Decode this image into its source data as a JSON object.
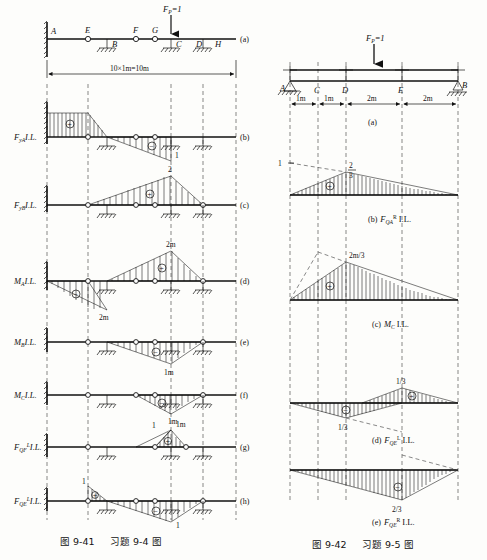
{
  "figure_left": {
    "caption_fig": "图 9-41",
    "caption_problem": "习题 9-4 图",
    "panel_letters": [
      "(a)",
      "(b)",
      "(c)",
      "(d)",
      "(e)",
      "(f)",
      "(g)",
      "(h)"
    ],
    "beam": {
      "load_label": "F",
      "load_sub": "P",
      "load_eq": "=1",
      "node_labels": [
        "A",
        "E",
        "F",
        "G",
        "H"
      ],
      "support_labels": [
        "B",
        "C",
        "D"
      ],
      "dimension": "10×1m=10m"
    },
    "rows": [
      {
        "id": "FyA",
        "label_main": "F",
        "label_sub": "yA",
        "label_sup": "",
        "label_tail": "I.L.",
        "signs": [
          "+",
          "−"
        ],
        "values": [
          "1"
        ]
      },
      {
        "id": "FyB",
        "label_main": "F",
        "label_sub": "yB",
        "label_sup": "",
        "label_tail": "I.L.",
        "signs": [
          "+"
        ],
        "values": [
          "2"
        ]
      },
      {
        "id": "MA",
        "label_main": "M",
        "label_sub": "A",
        "label_sup": "",
        "label_tail": "I.L.",
        "signs": [
          "−",
          "+"
        ],
        "values": [
          "2m",
          "2m"
        ]
      },
      {
        "id": "MB",
        "label_main": "M",
        "label_sub": "B",
        "label_sup": "",
        "label_tail": "I.L.",
        "signs": [
          "−"
        ],
        "values": [
          "1m"
        ]
      },
      {
        "id": "MC",
        "label_main": "M",
        "label_sub": "C",
        "label_sup": "",
        "label_tail": "I.L.",
        "signs": [
          "−"
        ],
        "values": [
          "1m"
        ]
      },
      {
        "id": "FQF-L",
        "label_main": "F",
        "label_sub": "QF",
        "label_sup": "L",
        "label_tail": "I.L.",
        "signs": [
          "+"
        ],
        "values": [
          "1",
          "1m"
        ]
      },
      {
        "id": "FQE-L",
        "label_main": "F",
        "label_sub": "QE",
        "label_sup": "L",
        "label_tail": "I.L.",
        "signs": [
          "+",
          "−"
        ],
        "values": [
          "1",
          "1"
        ]
      }
    ]
  },
  "figure_right": {
    "caption_fig": "图 9-42",
    "caption_problem": "习题 9-5 图",
    "beam": {
      "load_label": "F",
      "load_sub": "P",
      "load_eq": "=1",
      "node_labels": [
        "A",
        "C",
        "D",
        "E",
        "B"
      ],
      "dimensions": [
        "1m",
        "1m",
        "2m",
        "2m"
      ]
    },
    "panels": [
      {
        "tag": "(a)",
        "label_main": "",
        "label_sub": "",
        "label_sup": "",
        "label_tail": ""
      },
      {
        "tag": "(b)",
        "label_main": "F",
        "label_sub": "QA",
        "label_sup": "R",
        "label_tail": "I.L.",
        "sign": "+",
        "values": [
          "1",
          "2/3"
        ],
        "peak_num": "2",
        "peak_den": "3"
      },
      {
        "tag": "(c)",
        "label_main": "M",
        "label_sub": "C",
        "label_sup": "",
        "label_tail": "I.L.",
        "sign": "+",
        "values": [
          "2m/3"
        ]
      },
      {
        "tag": "(d)",
        "label_main": "F",
        "label_sub": "QE",
        "label_sup": "L",
        "label_tail": "I.L.",
        "signs": [
          "−",
          "+"
        ],
        "values": [
          "1/3",
          "1/3"
        ]
      },
      {
        "tag": "(e)",
        "label_main": "F",
        "label_sub": "QE",
        "label_sup": "R",
        "label_tail": "I.L.",
        "sign": "−",
        "values": [
          "2/3"
        ]
      }
    ]
  }
}
